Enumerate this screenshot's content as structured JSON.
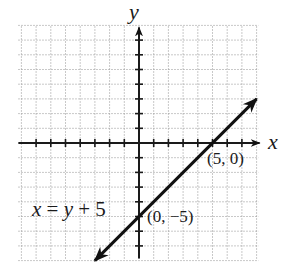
{
  "chart_data": {
    "type": "line",
    "title": "",
    "xlabel": "x",
    "ylabel": "y",
    "xlim": [
      -8,
      8
    ],
    "ylim": [
      -8,
      8
    ],
    "grid": true,
    "tick_step": 1,
    "series": [
      {
        "name": "x = y + 5",
        "equation": "x = y + 5",
        "x": [
          -3,
          0,
          5,
          8
        ],
        "y": [
          -8,
          -5,
          0,
          3
        ]
      }
    ],
    "annotations": [
      {
        "text": "(5, 0)",
        "x": 5,
        "y": 0
      },
      {
        "text": "(0, −5)",
        "x": 0,
        "y": -5
      },
      {
        "text": "x = y + 5",
        "x": -6.8,
        "y": -4.9
      }
    ],
    "legend": null
  },
  "labels": {
    "x_axis": "x",
    "y_axis": "y",
    "equation_lhs": "x",
    "equation_eq": " = ",
    "equation_rhs_var": "y",
    "equation_rhs_rest": " + 5",
    "point_a": "(5, 0)",
    "point_b": "(0, −5)"
  },
  "colors": {
    "grid": "#9a9a9a",
    "axis": "#1a1a1a",
    "line": "#111111",
    "background": "#ffffff"
  }
}
